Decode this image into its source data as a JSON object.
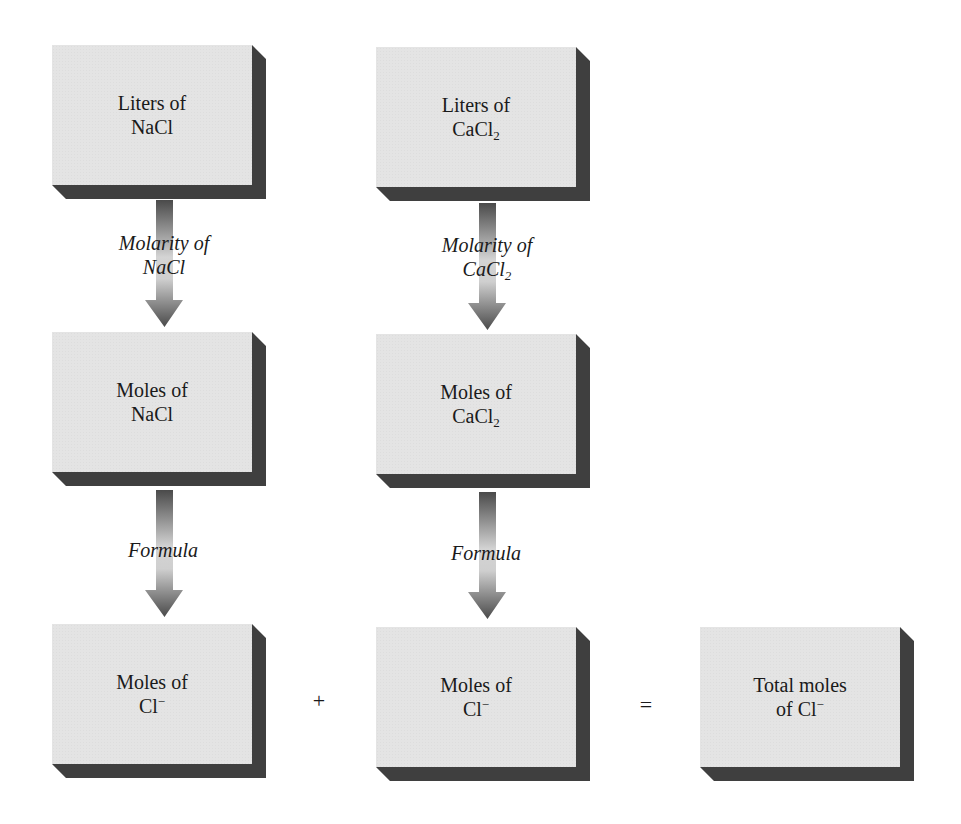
{
  "diagram": {
    "type": "flowchart",
    "colors": {
      "box_face": "#e4e4e4",
      "box_shadow": "#3f3f3f",
      "arrow_dark": "#4a4a4a",
      "arrow_light": "#d8d8d8",
      "text": "#1a1a1a",
      "background": "#ffffff"
    },
    "boxes": {
      "liters_nacl": {
        "line1": "Liters of",
        "line2_base": "NaCl",
        "line2_sub": "",
        "line2_sup": ""
      },
      "liters_cacl2": {
        "line1": "Liters of",
        "line2_base": "CaCl",
        "line2_sub": "2",
        "line2_sup": ""
      },
      "moles_nacl": {
        "line1": "Moles of",
        "line2_base": "NaCl",
        "line2_sub": "",
        "line2_sup": ""
      },
      "moles_cacl2": {
        "line1": "Moles of",
        "line2_base": "CaCl",
        "line2_sub": "2",
        "line2_sup": ""
      },
      "moles_cl_left": {
        "line1": "Moles of",
        "line2_base": "Cl",
        "line2_sub": "",
        "line2_sup": "−"
      },
      "moles_cl_right": {
        "line1": "Moles of",
        "line2_base": "Cl",
        "line2_sub": "",
        "line2_sup": "−"
      },
      "total_moles_cl": {
        "line1": "Total moles",
        "line2_base": "of Cl",
        "line2_sub": "",
        "line2_sup": "−"
      }
    },
    "arrows": {
      "nacl_molarity": {
        "line1": "Molarity of",
        "line2_base": "NaCl",
        "line2_sub": ""
      },
      "cacl2_molarity": {
        "line1": "Molarity of",
        "line2_base": "CaCl",
        "line2_sub": "2"
      },
      "nacl_formula": {
        "line1": "Formula"
      },
      "cacl2_formula": {
        "line1": "Formula"
      }
    },
    "operators": {
      "plus": "+",
      "equals": "="
    },
    "edges": [
      {
        "from": "liters_nacl",
        "to": "moles_nacl",
        "label": "Molarity of NaCl"
      },
      {
        "from": "moles_nacl",
        "to": "moles_cl_left",
        "label": "Formula"
      },
      {
        "from": "liters_cacl2",
        "to": "moles_cacl2",
        "label": "Molarity of CaCl2"
      },
      {
        "from": "moles_cacl2",
        "to": "moles_cl_right",
        "label": "Formula"
      },
      {
        "from": "moles_cl_left + moles_cl_right",
        "to": "total_moles_cl",
        "label": "="
      }
    ]
  }
}
